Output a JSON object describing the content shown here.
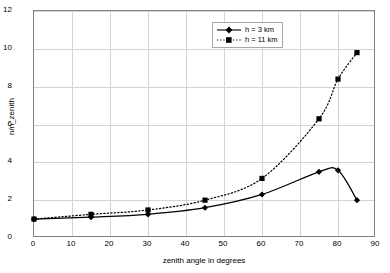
{
  "chart_data": {
    "type": "line",
    "title": "",
    "xlabel": "zenith angle in degrees",
    "ylabel": "n/n_zenith",
    "xlim": [
      0,
      90
    ],
    "ylim": [
      0,
      12
    ],
    "xticks": [
      0,
      10,
      20,
      30,
      40,
      50,
      60,
      70,
      80,
      90
    ],
    "yticks": [
      0,
      2,
      4,
      6,
      8,
      10,
      12
    ],
    "grid": true,
    "legend_position": "upper center",
    "series": [
      {
        "name": "h = 3 km",
        "marker": "diamond",
        "linestyle": "solid",
        "color": "#000000",
        "x": [
          0,
          15,
          30,
          45,
          60,
          75,
          80,
          85
        ],
        "values": [
          1.0,
          1.1,
          1.25,
          1.6,
          2.3,
          3.5,
          3.58,
          2.0
        ]
      },
      {
        "name": "h = 11 km",
        "marker": "square",
        "linestyle": "dotted",
        "color": "#000000",
        "x": [
          0,
          15,
          30,
          45,
          60,
          75,
          80,
          85
        ],
        "values": [
          1.0,
          1.25,
          1.48,
          2.0,
          3.15,
          6.3,
          8.4,
          9.8
        ]
      }
    ]
  },
  "axis": {
    "x_tick_labels": [
      "0",
      "10",
      "20",
      "30",
      "40",
      "50",
      "60",
      "70",
      "80",
      "90"
    ],
    "y_tick_labels": [
      "0",
      "2",
      "4",
      "6",
      "8",
      "10",
      "12"
    ],
    "x_title": "zenith angle in degrees",
    "y_title": "n/n_zenith"
  },
  "legend": {
    "entries": [
      {
        "label": "h = 3 km"
      },
      {
        "label": "h = 11 km"
      }
    ]
  },
  "colors": {
    "background": "#ffffff",
    "grid": "#d4d4d4",
    "frame": "#808080",
    "series": "#000000"
  }
}
